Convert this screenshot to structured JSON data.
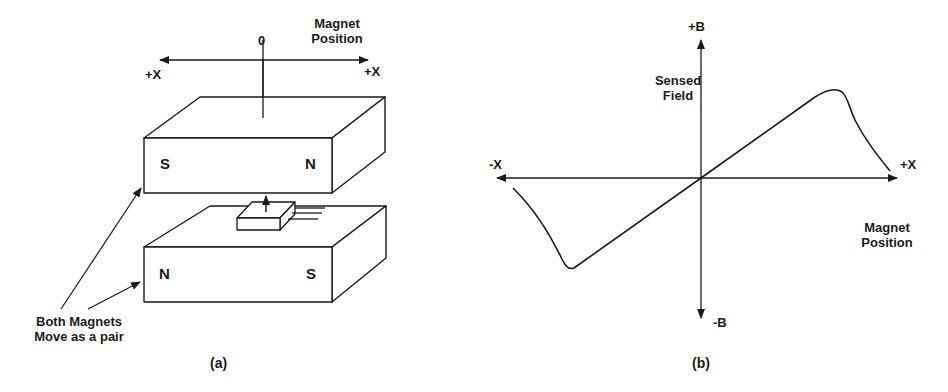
{
  "figure_a": {
    "caption": "(a)",
    "axis": {
      "zero_label": "0",
      "left_label": "+X",
      "right_label": "+X",
      "title_line1": "Magnet",
      "title_line2": "Position"
    },
    "top_magnet": {
      "left_pole": "S",
      "right_pole": "N"
    },
    "bottom_magnet": {
      "left_pole": "N",
      "right_pole": "S"
    },
    "sensor": {
      "description": "sensor chip with upward arrow and leads"
    },
    "annotation": {
      "line1": "Both Magnets",
      "line2": "Move as a pair"
    }
  },
  "figure_b": {
    "caption": "(b)",
    "y_top_label": "+B",
    "y_bottom_label": "-B",
    "x_left_label": "-X",
    "x_right_label": "+X",
    "y_title_line1": "Sensed",
    "y_title_line2": "Field",
    "x_title_line1": "Magnet",
    "x_title_line2": "Position"
  },
  "colors": {
    "ink": "#1a1a1a",
    "background": "#ffffff"
  }
}
